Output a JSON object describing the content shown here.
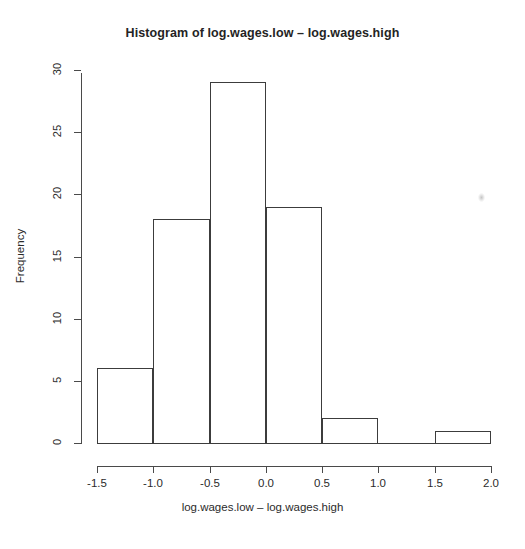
{
  "chart_data": {
    "type": "bar",
    "title": "Histogram of log.wages.low – log.wages.high",
    "xlabel": "log.wages.low – log.wages.high",
    "ylabel": "Frequency",
    "bin_edges": [
      -1.5,
      -1.0,
      -0.5,
      0.0,
      0.5,
      1.0,
      1.5,
      2.0
    ],
    "categories": [
      "-1.5 to -1.0",
      "-1.0 to -0.5",
      "-0.5 to 0.0",
      "0.0 to 0.5",
      "0.5 to 1.0",
      "1.0 to 1.5",
      "1.5 to 2.0"
    ],
    "values": [
      6,
      18,
      29,
      19,
      2,
      0,
      1
    ],
    "xlim": [
      -1.5,
      2.0
    ],
    "ylim": [
      0,
      30
    ],
    "xticks": [
      "-1.5",
      "-1.0",
      "-0.5",
      "0.0",
      "0.5",
      "1.0",
      "1.5",
      "2.0"
    ],
    "xtick_values": [
      -1.5,
      -1.0,
      -0.5,
      0.0,
      0.5,
      1.0,
      1.5,
      2.0
    ],
    "yticks": [
      "0",
      "5",
      "10",
      "15",
      "20",
      "25",
      "30"
    ],
    "ytick_values": [
      0,
      5,
      10,
      15,
      20,
      25,
      30
    ],
    "grid": false,
    "legend": false,
    "bar_fill": "#ffffff",
    "bar_stroke": "#3c3c3c",
    "background": "#ffffff"
  }
}
